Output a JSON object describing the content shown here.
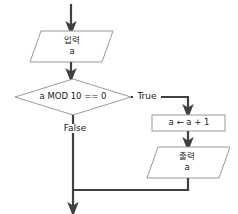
{
  "diagram": {
    "colors": {
      "shape_stroke": "#999999",
      "connector_stroke": "#404040",
      "shape_fill": "#ffffff",
      "text": "#1a1a1a",
      "background": "#ffffff"
    },
    "nodes": {
      "entry_arrow": {
        "type": "arrow",
        "label": ""
      },
      "input": {
        "type": "parallelogram",
        "keyword": "입력",
        "variable": "a"
      },
      "decision": {
        "type": "diamond",
        "condition": "a MOD 10 == 0"
      },
      "process": {
        "type": "rectangle",
        "statement": "a ← a + 1"
      },
      "output": {
        "type": "parallelogram",
        "keyword": "출력",
        "variable": "a"
      }
    },
    "edges": {
      "true_label": "True",
      "false_label": "False"
    }
  }
}
